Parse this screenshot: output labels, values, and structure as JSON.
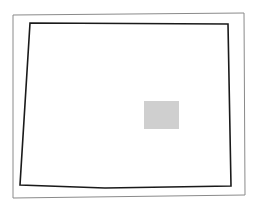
{
  "diagram": {
    "width": 257,
    "height": 210,
    "background": "#ffffff",
    "outer_frame": {
      "points": "13,15 244,13 245,195 13,198",
      "stroke": "#8a8a8a",
      "stroke_width": 1
    },
    "outline_polygon": {
      "points": "30,23 228,24 231,186 105,188 20,185",
      "stroke": "#1a1a1a",
      "stroke_width": 1.6
    },
    "shaded_region": {
      "x": 144,
      "y": 101,
      "width": 35,
      "height": 28,
      "fill": "#cfcfcf"
    }
  }
}
